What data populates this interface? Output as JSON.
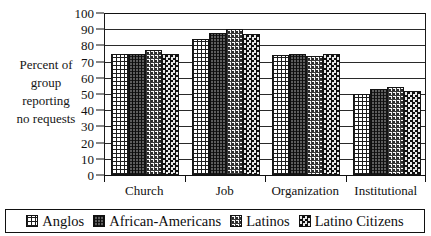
{
  "chart_data": {
    "type": "bar",
    "title": "",
    "xlabel": "",
    "ylabel": "Percent of group reporting no requests",
    "ylim": [
      0,
      100
    ],
    "ytick_step": 10,
    "yticks": [
      100,
      90,
      80,
      70,
      60,
      50,
      40,
      30,
      20,
      10,
      0
    ],
    "grid": true,
    "legend_position": "bottom",
    "categories": [
      "Church",
      "Job",
      "Organization",
      "Institutional"
    ],
    "series": [
      {
        "name": "Anglos",
        "pattern": "grid",
        "values": [
          75,
          84,
          74,
          50
        ]
      },
      {
        "name": "African-Americans",
        "pattern": "dense-lines",
        "values": [
          74.5,
          87.5,
          75,
          53
        ]
      },
      {
        "name": "Latinos",
        "pattern": "dots",
        "values": [
          77,
          90,
          73.5,
          54.5
        ]
      },
      {
        "name": "Latino Citizens",
        "pattern": "checkerboard",
        "values": [
          75,
          87,
          74.5,
          52
        ]
      }
    ]
  },
  "axis_caption_lines": [
    "Percent of",
    "group",
    "reporting",
    "no requests"
  ],
  "colors": {
    "axis": "#111111",
    "gridline": "#2a2a2a",
    "background": "#ffffff",
    "bar_outline": "#141414"
  }
}
